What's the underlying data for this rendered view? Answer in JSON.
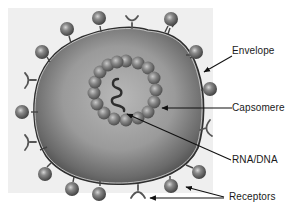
{
  "diagram": {
    "labels": {
      "envelope": "Envelope",
      "capsomere": "Capsomere",
      "nucleic_acid": "RNA/DNA",
      "receptors": "Receptors"
    },
    "colors": {
      "background": "#ffffff",
      "backdrop": "#ececec",
      "envelope_fill": "#8a8a8a",
      "envelope_outline": "#3a3a3a",
      "capsomere": "#6e6e6e",
      "spike": "#5a5a5a",
      "label_text": "#1a1a1a",
      "arrow": "#111111"
    }
  }
}
